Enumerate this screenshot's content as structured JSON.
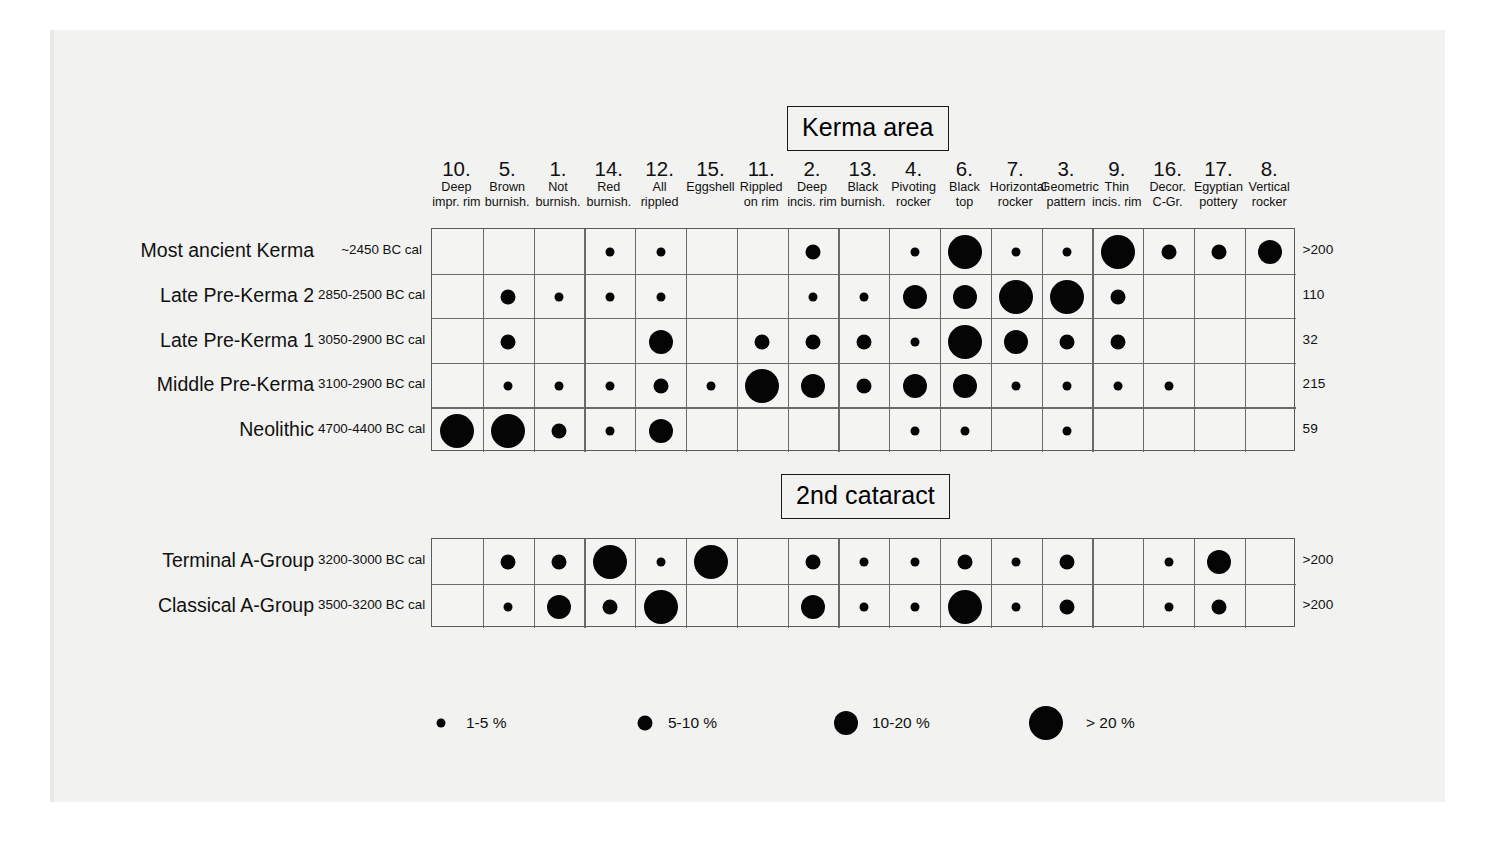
{
  "figure": {
    "sections": [
      {
        "id": "kerma",
        "title": "Kerma area"
      },
      {
        "id": "cataract",
        "title": "2nd cataract"
      }
    ]
  },
  "columns": [
    {
      "num": "10.",
      "line1": "Deep",
      "line2": "impr. rim"
    },
    {
      "num": "5.",
      "line1": "Brown",
      "line2": "burnish."
    },
    {
      "num": "1.",
      "line1": "Not",
      "line2": "burnish."
    },
    {
      "num": "14.",
      "line1": "Red",
      "line2": "burnish."
    },
    {
      "num": "12.",
      "line1": "All",
      "line2": "rippled"
    },
    {
      "num": "15.",
      "line1": "Eggshell",
      "line2": ""
    },
    {
      "num": "11.",
      "line1": "Rippled",
      "line2": "on rim"
    },
    {
      "num": "2.",
      "line1": "Deep",
      "line2": "incis. rim"
    },
    {
      "num": "13.",
      "line1": "Black",
      "line2": "burnish."
    },
    {
      "num": "4.",
      "line1": "Pivoting",
      "line2": "rocker"
    },
    {
      "num": "6.",
      "line1": "Black",
      "line2": "top"
    },
    {
      "num": "7.",
      "line1": "Horizontal",
      "line2": "rocker"
    },
    {
      "num": "3.",
      "line1": "Geometric",
      "line2": "pattern"
    },
    {
      "num": "9.",
      "line1": "Thin",
      "line2": "incis. rim"
    },
    {
      "num": "16.",
      "line1": "Decor.",
      "line2": "C-Gr."
    },
    {
      "num": "17.",
      "line1": "Egyptian",
      "line2": "pottery"
    },
    {
      "num": "8.",
      "line1": "Vertical",
      "line2": "rocker"
    }
  ],
  "chart_data": {
    "type": "heatmap",
    "xlabel": "",
    "ylabel": "",
    "grid": true,
    "legend_position": "bottom",
    "size_scale": [
      {
        "class": 1,
        "label": "1-5 %",
        "diameter_px": 9
      },
      {
        "class": 2,
        "label": "5-10 %",
        "diameter_px": 15
      },
      {
        "class": 3,
        "label": "10-20 %",
        "diameter_px": 24
      },
      {
        "class": 4,
        "label": "> 20 %",
        "diameter_px": 34
      }
    ],
    "categories": [
      "10. Deep impr. rim",
      "5. Brown burnish.",
      "1. Not burnish.",
      "14. Red burnish.",
      "12. All rippled",
      "15. Eggshell",
      "11. Rippled on rim",
      "2. Deep incis. rim",
      "13. Black burnish.",
      "4. Pivoting rocker",
      "6. Black top",
      "7. Horizontal rocker",
      "3. Geometric pattern",
      "9. Thin incis. rim",
      "16. Decor. C-Gr.",
      "17. Egyptian pottery",
      "8. Vertical rocker"
    ],
    "series": [
      {
        "name": "Most ancient Kerma",
        "section": "kerma",
        "date": "~2450 BC cal",
        "count": ">200",
        "values": [
          0,
          0,
          0,
          1,
          1,
          0,
          0,
          2,
          0,
          1,
          4,
          1,
          1,
          4,
          2,
          2,
          3
        ]
      },
      {
        "name": "Late Pre-Kerma 2",
        "section": "kerma",
        "date": "2850-2500 BC cal",
        "count": "110",
        "values": [
          0,
          2,
          1,
          1,
          1,
          0,
          0,
          1,
          1,
          3,
          3,
          4,
          4,
          2,
          0,
          0,
          0
        ]
      },
      {
        "name": "Late Pre-Kerma 1",
        "section": "kerma",
        "date": "3050-2900 BC cal",
        "count": "32",
        "values": [
          0,
          2,
          0,
          0,
          3,
          0,
          2,
          2,
          2,
          1,
          4,
          3,
          2,
          2,
          0,
          0,
          0
        ]
      },
      {
        "name": "Middle Pre-Kerma",
        "section": "kerma",
        "date": "3100-2900 BC cal",
        "count": "215",
        "values": [
          0,
          1,
          1,
          1,
          2,
          1,
          4,
          3,
          2,
          3,
          3,
          1,
          1,
          1,
          1,
          0,
          0
        ]
      },
      {
        "name": "Neolithic",
        "section": "kerma",
        "date": "4700-4400 BC cal",
        "count": "59",
        "values": [
          4,
          4,
          2,
          1,
          3,
          0,
          0,
          0,
          0,
          1,
          1,
          0,
          1,
          0,
          0,
          0,
          0
        ]
      },
      {
        "name": "Terminal A-Group",
        "section": "cataract",
        "date": "3200-3000 BC cal",
        "count": ">200",
        "values": [
          0,
          2,
          2,
          4,
          1,
          4,
          0,
          2,
          1,
          1,
          2,
          1,
          2,
          0,
          1,
          3,
          0
        ]
      },
      {
        "name": "Classical A-Group",
        "section": "cataract",
        "date": "3500-3200 BC cal",
        "count": ">200",
        "values": [
          0,
          1,
          3,
          2,
          4,
          0,
          0,
          3,
          1,
          1,
          4,
          1,
          2,
          0,
          1,
          2,
          0
        ]
      }
    ]
  },
  "legend": {
    "items": [
      {
        "label": "1-5 %"
      },
      {
        "label": "5-10 %"
      },
      {
        "label": "10-20 %"
      },
      {
        "label": "> 20 %"
      }
    ]
  },
  "colors": {
    "dot": "#050505",
    "grid_line": "#6a6a6a",
    "page_background": "#f2f2f0",
    "text": "#111111"
  }
}
